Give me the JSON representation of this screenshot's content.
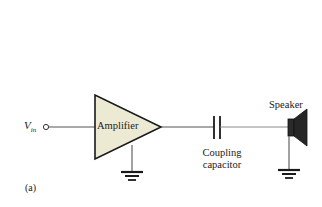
{
  "figure": {
    "caption": "(a)",
    "type": "circuit-diagram",
    "background_color": "#ffffff",
    "line_color": "#1a1a1a",
    "amplifier_fill_color": "#edead4",
    "speaker_fill_color": "#222222"
  },
  "labels": {
    "input_symbol": "V",
    "input_subscript": "in",
    "amplifier": "Amplifier",
    "coupling_capacitor_line1": "Coupling",
    "coupling_capacitor_line2": "capacitor",
    "speaker": "Speaker"
  },
  "components": [
    {
      "name": "input-terminal",
      "label": "V in"
    },
    {
      "name": "amplifier",
      "label": "Amplifier"
    },
    {
      "name": "amplifier-ground",
      "label": "ground"
    },
    {
      "name": "coupling-capacitor",
      "label": "Coupling capacitor"
    },
    {
      "name": "speaker",
      "label": "Speaker"
    },
    {
      "name": "speaker-ground",
      "label": "ground"
    }
  ]
}
